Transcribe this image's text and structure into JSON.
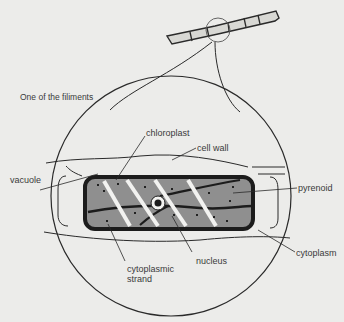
{
  "title": "One of the filiments",
  "labels": {
    "chloroplast": "chloroplast",
    "cell_wall": "cell wall",
    "vacuole": "vacuole",
    "pyrenoid": "pyrenoid",
    "cytoplasm": "cytoplasm",
    "nucleus": "nucleus",
    "cytoplasmic_strand_1": "cytoplasmic",
    "cytoplasmic_strand_2": "strand"
  },
  "colors": {
    "background": "#ececea",
    "line": "#2a2a2a",
    "cell_fill": "#8f8f8f",
    "chloroplast": "#f2f2f0"
  }
}
